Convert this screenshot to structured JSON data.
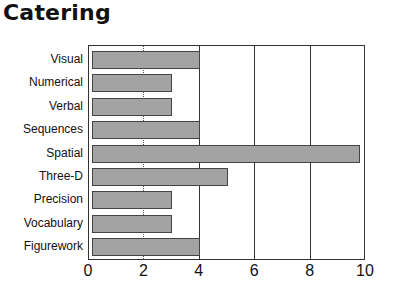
{
  "chart_data": {
    "type": "bar",
    "orientation": "horizontal",
    "title": "Catering",
    "xlabel": "",
    "ylabel": "",
    "categories": [
      "Visual",
      "Numerical",
      "Verbal",
      "Sequences",
      "Spatial",
      "Three-D",
      "Precision",
      "Vocabulary",
      "Figurework"
    ],
    "values": [
      4,
      3,
      3,
      4,
      9.8,
      5,
      3,
      3,
      4
    ],
    "xlim": [
      0,
      10
    ],
    "xticks": [
      "0",
      "2",
      "4",
      "6",
      "8",
      "10"
    ],
    "grid": "vertical lines at 4, 6, 8",
    "bar_color": "#a3a3a3",
    "legend": null
  }
}
